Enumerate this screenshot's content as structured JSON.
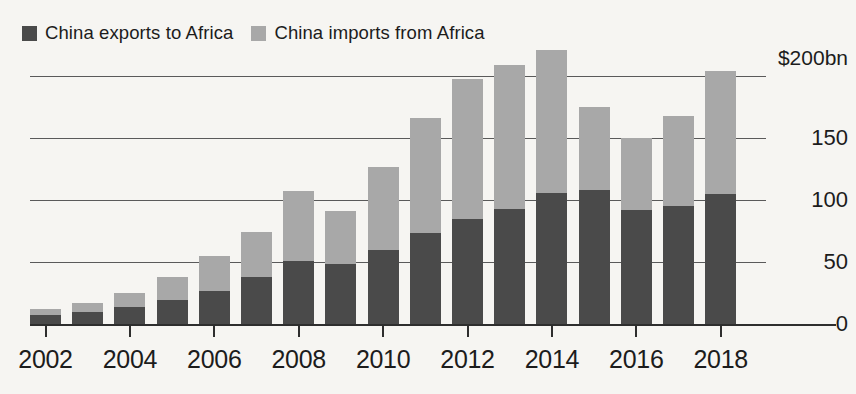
{
  "legend": {
    "entries": [
      {
        "label": "China exports to Africa",
        "color": "#4a4a4a",
        "swatch_name": "exports-swatch"
      },
      {
        "label": "China imports from Africa",
        "color": "#a8a8a8",
        "swatch_name": "imports-swatch"
      }
    ]
  },
  "colors": {
    "exports": "#4a4a4a",
    "imports": "#a8a8a8",
    "background": "#f6f5f2",
    "gridline": "#5a5a5a",
    "axis": "#2e2e2e",
    "text": "#1c1c1c"
  },
  "axis": {
    "y_ticks": [
      {
        "value": 200,
        "label": "$200bn"
      },
      {
        "value": 150,
        "label": "150"
      },
      {
        "value": 100,
        "label": "100"
      },
      {
        "value": 50,
        "label": "50"
      },
      {
        "value": 0,
        "label": "0"
      }
    ],
    "x_ticks": [
      {
        "year": 2002,
        "label": "2002"
      },
      {
        "year": 2004,
        "label": "2004"
      },
      {
        "year": 2006,
        "label": "2006"
      },
      {
        "year": 2008,
        "label": "2008"
      },
      {
        "year": 2010,
        "label": "2010"
      },
      {
        "year": 2012,
        "label": "2012"
      },
      {
        "year": 2014,
        "label": "2014"
      },
      {
        "year": 2016,
        "label": "2016"
      },
      {
        "year": 2018,
        "label": "2018"
      }
    ]
  },
  "chart_data": {
    "type": "bar",
    "stacked": true,
    "title": "",
    "subtitle": "",
    "xlabel": "",
    "ylabel": "$200bn",
    "unit": "$bn",
    "ylim": [
      0,
      210
    ],
    "ytick_interval": 50,
    "grid": true,
    "legend_position": "top-left",
    "categories": [
      "2002",
      "2003",
      "2004",
      "2005",
      "2006",
      "2007",
      "2008",
      "2009",
      "2010",
      "2011",
      "2012",
      "2013",
      "2014",
      "2015",
      "2016",
      "2017",
      "2018"
    ],
    "series": [
      {
        "name": "China exports to Africa",
        "color": "#4a4a4a",
        "values": [
          7,
          10,
          14,
          19,
          27,
          38,
          51,
          48,
          60,
          73,
          85,
          93,
          106,
          108,
          92,
          95,
          105
        ]
      },
      {
        "name": "China imports from Africa",
        "color": "#a8a8a8",
        "values": [
          5,
          7,
          11,
          19,
          28,
          36,
          56,
          43,
          67,
          93,
          113,
          116,
          115,
          67,
          58,
          73,
          99
        ]
      }
    ],
    "totals": [
      12,
      17,
      25,
      38,
      55,
      74,
      107,
      91,
      127,
      166,
      198,
      209,
      221,
      175,
      150,
      168,
      204
    ]
  }
}
